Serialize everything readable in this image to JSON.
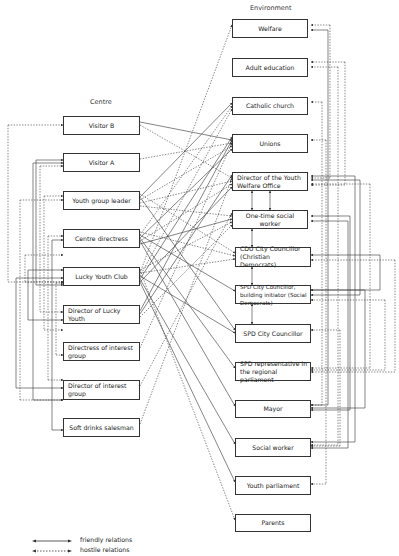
{
  "titles": {
    "environment": "Environment",
    "centre": "Centre"
  },
  "centre_nodes": [
    {
      "id": "visitor_b",
      "label": "Visitor B",
      "y": 116,
      "h": 19,
      "italic_suffix": true
    },
    {
      "id": "visitor_a",
      "label": "Visitor A",
      "y": 153,
      "h": 19
    },
    {
      "id": "youth_group_leader",
      "label": "Youth group leader",
      "y": 191,
      "h": 19
    },
    {
      "id": "centre_directress",
      "label": "Centre directress",
      "y": 229,
      "h": 19
    },
    {
      "id": "lucky_youth_club",
      "label": "Lucky Youth Club",
      "y": 267,
      "h": 19
    },
    {
      "id": "director_lucky_youth",
      "label": "Director of Lucky Youth",
      "y": 305,
      "h": 19
    },
    {
      "id": "directress_interest",
      "label": "Directress of interest group",
      "y": 342,
      "h": 19
    },
    {
      "id": "director_interest",
      "label": "Director of interest group",
      "y": 380,
      "h": 20
    },
    {
      "id": "soft_drinks",
      "label": "Soft drinks salesman",
      "y": 418,
      "h": 19
    }
  ],
  "environment_nodes": [
    {
      "id": "welfare",
      "label": "Welfare",
      "y": 19,
      "h": 19
    },
    {
      "id": "adult_education",
      "label": "Adult education",
      "y": 58,
      "h": 19
    },
    {
      "id": "catholic_church",
      "label": "Catholic church",
      "y": 97,
      "h": 18
    },
    {
      "id": "unions",
      "label": "Unions",
      "y": 134,
      "h": 19
    },
    {
      "id": "director_ywo",
      "label": "Director of the Youth Welfare Office",
      "y": 172,
      "h": 19
    },
    {
      "id": "one_time_sw",
      "label": "One-time social worker",
      "y": 210,
      "h": 19
    },
    {
      "id": "cdu",
      "label": "CDU City Councillor (Christian Democrats)",
      "y": 247,
      "h": 20
    },
    {
      "id": "spd_building",
      "label": "SPD City Councillor, building initiator (Social Democrats)",
      "y": 285,
      "h": 19
    },
    {
      "id": "spd_city",
      "label": "SPD City Councillor",
      "y": 324,
      "h": 19
    },
    {
      "id": "spd_rep",
      "label": "SPD representative in the regional parliament",
      "y": 362,
      "h": 19
    },
    {
      "id": "mayor",
      "label": "Mayor",
      "y": 400,
      "h": 18
    },
    {
      "id": "social_worker",
      "label": "Social worker",
      "y": 438,
      "h": 19
    },
    {
      "id": "youth_parliament",
      "label": "Youth parliament",
      "y": 476,
      "h": 19
    },
    {
      "id": "parents",
      "label": "Parents",
      "y": 514,
      "h": 18
    }
  ],
  "legend": {
    "friendly": "friendly relations",
    "hostile": "hostile relations"
  },
  "edges": {
    "cross": [
      [
        "visitor_b",
        "unions",
        "friendly"
      ],
      [
        "visitor_b",
        "director_ywo",
        "hostile"
      ],
      [
        "visitor_a",
        "unions",
        "hostile"
      ],
      [
        "youth_group_leader",
        "catholic_church",
        "friendly"
      ],
      [
        "youth_group_leader",
        "unions",
        "hostile"
      ],
      [
        "youth_group_leader",
        "director_ywo",
        "hostile"
      ],
      [
        "youth_group_leader",
        "one_time_sw",
        "hostile"
      ],
      [
        "youth_group_leader",
        "cdu",
        "hostile"
      ],
      [
        "youth_group_leader",
        "spd_city",
        "friendly"
      ],
      [
        "centre_directress",
        "catholic_church",
        "hostile"
      ],
      [
        "centre_directress",
        "unions",
        "friendly"
      ],
      [
        "centre_directress",
        "director_ywo",
        "hostile"
      ],
      [
        "centre_directress",
        "one_time_sw",
        "friendly"
      ],
      [
        "centre_directress",
        "cdu",
        "hostile"
      ],
      [
        "centre_directress",
        "spd_building",
        "friendly"
      ],
      [
        "centre_directress",
        "spd_rep",
        "friendly"
      ],
      [
        "centre_directress",
        "mayor",
        "friendly"
      ],
      [
        "lucky_youth_club",
        "welfare",
        "hostile"
      ],
      [
        "lucky_youth_club",
        "catholic_church",
        "hostile"
      ],
      [
        "lucky_youth_club",
        "unions",
        "friendly"
      ],
      [
        "lucky_youth_club",
        "director_ywo",
        "friendly"
      ],
      [
        "lucky_youth_club",
        "one_time_sw",
        "hostile"
      ],
      [
        "lucky_youth_club",
        "cdu",
        "hostile"
      ],
      [
        "lucky_youth_club",
        "spd_city",
        "friendly"
      ],
      [
        "lucky_youth_club",
        "social_worker",
        "friendly"
      ],
      [
        "lucky_youth_club",
        "youth_parliament",
        "friendly"
      ],
      [
        "lucky_youth_club",
        "parents",
        "hostile"
      ],
      [
        "director_lucky_youth",
        "unions",
        "friendly"
      ],
      [
        "director_lucky_youth",
        "director_ywo",
        "friendly"
      ],
      [
        "director_lucky_youth",
        "one_time_sw",
        "hostile"
      ],
      [
        "directress_interest",
        "unions",
        "hostile"
      ],
      [
        "director_interest",
        "one_time_sw",
        "hostile"
      ],
      [
        "soft_drinks",
        "director_ywo",
        "hostile"
      ]
    ],
    "vertical_env": [
      [
        "director_ywo",
        "one_time_sw"
      ],
      [
        "one_time_sw",
        "cdu"
      ],
      [
        "cdu",
        "spd_building"
      ],
      [
        "spd_building",
        "spd_city"
      ]
    ]
  },
  "colors": {
    "line": "#333333",
    "box_border": "#333333",
    "background": "#ffffff"
  }
}
